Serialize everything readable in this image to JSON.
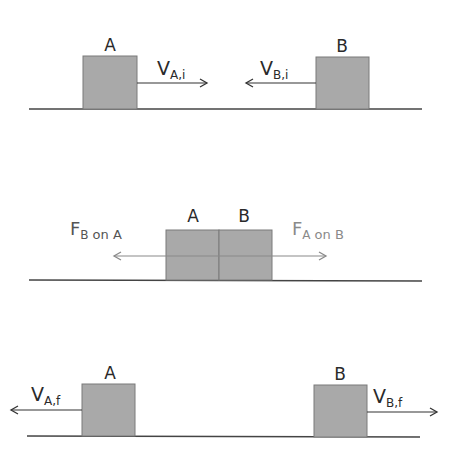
{
  "colors": {
    "block_fill": "#a9a9a9",
    "block_stroke": "#7a7a7a",
    "ground": "#444444",
    "arrow_dark": "#333333",
    "arrow_light": "#8a8a8a"
  },
  "panels": [
    {
      "id": "before-collision",
      "block_a_label": "A",
      "block_b_label": "B",
      "vel_a": {
        "main": "V",
        "sub": "A,i"
      },
      "vel_b": {
        "main": "V",
        "sub": "B,i"
      }
    },
    {
      "id": "during-collision",
      "block_a_label": "A",
      "block_b_label": "B",
      "force_b_on_a": {
        "main": "F",
        "sub": "B",
        "rest": "on A"
      },
      "force_a_on_b": {
        "main": "F",
        "sub": "A",
        "rest": "on B"
      }
    },
    {
      "id": "after-collision",
      "block_a_label": "A",
      "block_b_label": "B",
      "vel_a": {
        "main": "V",
        "sub": "A,f"
      },
      "vel_b": {
        "main": "V",
        "sub": "B,f"
      }
    }
  ]
}
